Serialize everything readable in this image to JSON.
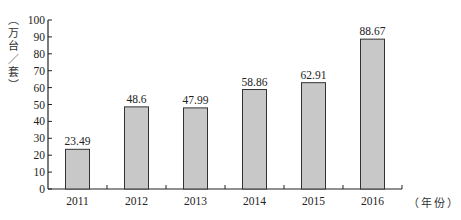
{
  "chart_data": {
    "type": "bar",
    "title": "",
    "xlabel": "（年份）",
    "ylabel": "（万台/套）",
    "categories": [
      "2011",
      "2012",
      "2013",
      "2014",
      "2015",
      "2016"
    ],
    "values": [
      23.49,
      48.6,
      47.99,
      58.86,
      62.91,
      88.67
    ],
    "data_labels": [
      "23.49",
      "48.6",
      "47.99",
      "58.86",
      "62.91",
      "88.67"
    ],
    "ylim": [
      0,
      100
    ],
    "yticks": [
      0,
      10,
      20,
      30,
      40,
      50,
      60,
      70,
      80,
      90,
      100
    ],
    "grid": false,
    "legend": null,
    "bar_color": "#c8c8c8",
    "bar_edge_color": "#333333"
  },
  "labels": {
    "ytitle": "（万台/套）",
    "xunit": "（年份）"
  }
}
